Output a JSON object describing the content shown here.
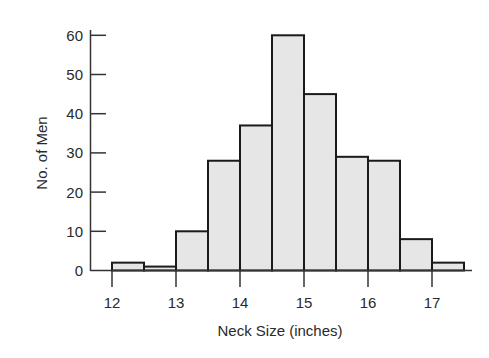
{
  "chart_data": {
    "type": "bar",
    "subtype": "histogram",
    "title": "",
    "xlabel": "Neck Size (inches)",
    "ylabel": "No. of Men",
    "bin_width": 0.5,
    "bins": [
      {
        "start": 12.0,
        "end": 12.5,
        "count": 2
      },
      {
        "start": 12.5,
        "end": 13.0,
        "count": 1
      },
      {
        "start": 13.0,
        "end": 13.5,
        "count": 10
      },
      {
        "start": 13.5,
        "end": 14.0,
        "count": 28
      },
      {
        "start": 14.0,
        "end": 14.5,
        "count": 37
      },
      {
        "start": 14.5,
        "end": 15.0,
        "count": 60
      },
      {
        "start": 15.0,
        "end": 15.5,
        "count": 45
      },
      {
        "start": 15.5,
        "end": 16.0,
        "count": 29
      },
      {
        "start": 16.0,
        "end": 16.5,
        "count": 28
      },
      {
        "start": 16.5,
        "end": 17.0,
        "count": 8
      },
      {
        "start": 17.0,
        "end": 17.5,
        "count": 2
      }
    ],
    "categories": [
      "12-12.5",
      "12.5-13",
      "13-13.5",
      "13.5-14",
      "14-14.5",
      "14.5-15",
      "15-15.5",
      "15.5-16",
      "16-16.5",
      "16.5-17",
      "17-17.5"
    ],
    "values": [
      2,
      1,
      10,
      28,
      37,
      60,
      45,
      29,
      28,
      8,
      2
    ],
    "xticks": [
      12,
      13,
      14,
      15,
      16,
      17
    ],
    "yticks": [
      0,
      10,
      20,
      30,
      40,
      50,
      60
    ],
    "xlim": [
      11.7,
      17.8
    ],
    "ylim": [
      0,
      60
    ],
    "grid": false,
    "legend": null,
    "colors": {
      "bar_fill": "#e6e6e6",
      "bar_edge": "#1a1a1a"
    }
  }
}
